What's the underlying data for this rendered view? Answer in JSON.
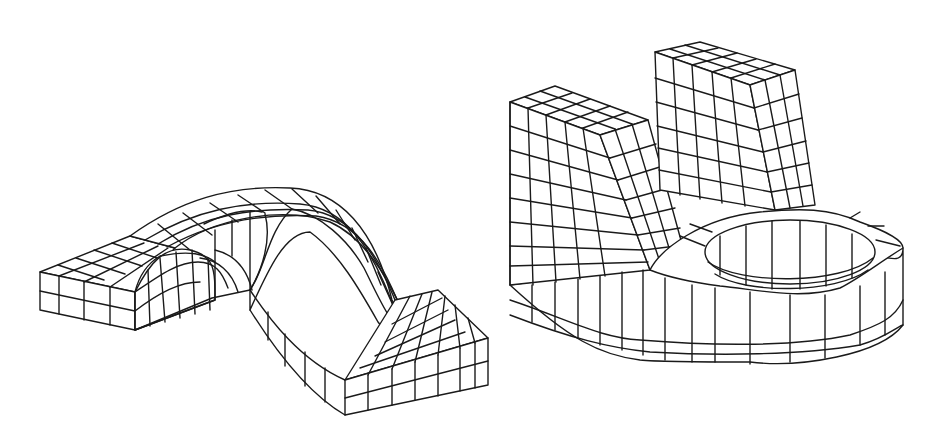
{
  "figure": {
    "background": "#ffffff",
    "line_color": "#1a1a1a",
    "models": [
      {
        "id": "left",
        "description": "Hexahedral mesh of a bent strap / bracket: two flat flanges joined by a semicircular arch",
        "grid": {
          "flange_rows_deep": 3,
          "thickness_layers": 2,
          "arch_segments": 10
        }
      },
      {
        "id": "right",
        "description": "Hexahedral mesh of a block with two upright pillars and a rounded base containing a circular hole",
        "grid": {
          "pillar_cols": 5,
          "pillar_rows": 9,
          "base_layers": 3
        }
      }
    ]
  }
}
